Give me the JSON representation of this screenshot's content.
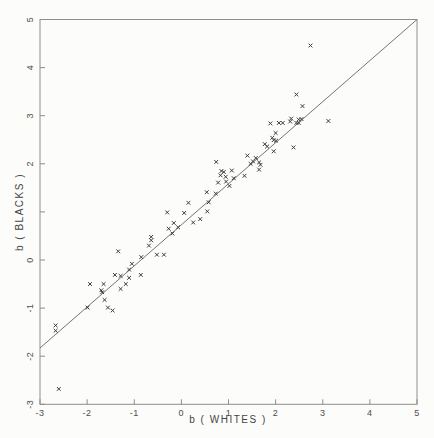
{
  "figure": {
    "background_color": "#fcfcfa",
    "axis_color": "#8e8e8e",
    "line_color": "#757575",
    "marker_color": "#3c3c3c",
    "tick_text_color": "#4d4d4d"
  },
  "chart_data": {
    "type": "scatter",
    "title": "",
    "xlabel": "b ( WHITES )",
    "ylabel": "b ( BLACKS )",
    "xlim": [
      -3,
      5
    ],
    "ylim": [
      -3,
      5
    ],
    "grid": false,
    "legend": "none",
    "marker": "x",
    "x_ticks": [
      -3,
      -2,
      -1,
      0,
      1,
      2,
      3,
      4,
      5
    ],
    "x_tick_labels": [
      "-3",
      "-2",
      "-1",
      "0",
      "1",
      "2",
      "3",
      "4",
      "5"
    ],
    "y_ticks": [
      -3,
      -2,
      -1,
      0,
      1,
      2,
      3,
      4,
      5
    ],
    "y_tick_labels": [
      "-3",
      "-2",
      "-1",
      "0",
      "",
      "2",
      "3",
      "4",
      "5"
    ],
    "y_tick_labels_rotated": true,
    "fit_line": {
      "x1": -3,
      "y1": -1.83,
      "x2": 5,
      "y2": 5.0,
      "slope": 0.854,
      "intercept": 0.73
    },
    "points": [
      [
        -2.6,
        -2.68
      ],
      [
        -2.67,
        -1.36
      ],
      [
        -2.67,
        -1.47
      ],
      [
        -1.99,
        -0.99
      ],
      [
        -1.94,
        -0.5
      ],
      [
        -1.7,
        -0.63
      ],
      [
        -1.68,
        -0.67
      ],
      [
        -1.65,
        -0.5
      ],
      [
        -1.63,
        -0.83
      ],
      [
        -1.56,
        -0.99
      ],
      [
        -1.46,
        -1.05
      ],
      [
        -1.41,
        -0.31
      ],
      [
        -1.34,
        0.18
      ],
      [
        -1.29,
        -0.33
      ],
      [
        -1.29,
        -0.6
      ],
      [
        -1.18,
        -0.5
      ],
      [
        -1.11,
        -0.2
      ],
      [
        -1.11,
        -0.37
      ],
      [
        -1.05,
        -0.08
      ],
      [
        -0.86,
        -0.31
      ],
      [
        -0.85,
        0.06
      ],
      [
        -0.69,
        0.3
      ],
      [
        -0.64,
        0.48
      ],
      [
        -0.64,
        0.41
      ],
      [
        -0.52,
        0.11
      ],
      [
        -0.37,
        0.11
      ],
      [
        -0.3,
        0.99
      ],
      [
        -0.27,
        0.65
      ],
      [
        -0.19,
        0.55
      ],
      [
        -0.16,
        0.77
      ],
      [
        -0.07,
        0.68
      ],
      [
        0.06,
        0.98
      ],
      [
        0.15,
        1.19
      ],
      [
        0.25,
        0.78
      ],
      [
        0.4,
        0.85
      ],
      [
        0.54,
        1.41
      ],
      [
        0.55,
        1.01
      ],
      [
        0.58,
        1.2
      ],
      [
        0.73,
        1.38
      ],
      [
        0.74,
        2.04
      ],
      [
        0.78,
        1.61
      ],
      [
        0.83,
        1.76
      ],
      [
        0.85,
        1.85
      ],
      [
        0.9,
        1.83
      ],
      [
        0.94,
        1.73
      ],
      [
        0.95,
        1.63
      ],
      [
        1.02,
        1.54
      ],
      [
        1.07,
        1.86
      ],
      [
        1.11,
        1.7
      ],
      [
        1.34,
        1.75
      ],
      [
        1.4,
        2.17
      ],
      [
        1.47,
        2.0
      ],
      [
        1.52,
        2.05
      ],
      [
        1.58,
        2.12
      ],
      [
        1.65,
        2.03
      ],
      [
        1.68,
        1.98
      ],
      [
        1.65,
        1.88
      ],
      [
        1.77,
        2.41
      ],
      [
        1.82,
        2.36
      ],
      [
        1.89,
        2.84
      ],
      [
        1.93,
        2.54
      ],
      [
        1.96,
        2.49
      ],
      [
        1.96,
        2.26
      ],
      [
        2.0,
        2.64
      ],
      [
        2.01,
        2.48
      ],
      [
        2.07,
        2.85
      ],
      [
        2.15,
        2.85
      ],
      [
        2.31,
        2.88
      ],
      [
        2.33,
        2.94
      ],
      [
        2.38,
        2.34
      ],
      [
        2.44,
        2.85
      ],
      [
        2.49,
        2.85
      ],
      [
        2.49,
        2.92
      ],
      [
        2.55,
        2.93
      ],
      [
        2.57,
        3.2
      ],
      [
        2.44,
        3.44
      ],
      [
        2.74,
        4.46
      ],
      [
        3.12,
        2.89
      ]
    ]
  }
}
